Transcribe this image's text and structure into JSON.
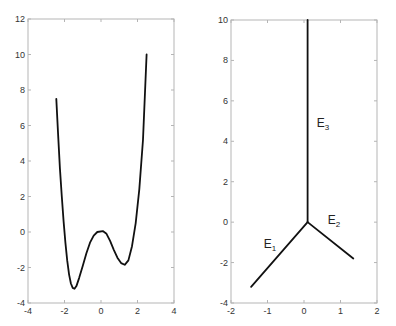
{
  "chart_data": [
    {
      "type": "line",
      "title": "",
      "xlabel": "",
      "ylabel": "",
      "xlim": [
        -4,
        4
      ],
      "ylim": [
        -4,
        12
      ],
      "xticks": [
        -4,
        -2,
        0,
        2,
        4
      ],
      "yticks": [
        -4,
        -2,
        0,
        2,
        4,
        6,
        8,
        10,
        12
      ],
      "grid": false,
      "legend": null,
      "frame_px": {
        "left": 28,
        "right": 174,
        "top": 19,
        "bottom": 303
      },
      "series": [
        {
          "name": "curve",
          "color": "#111111",
          "x": [
            -2.45,
            -2.35,
            -2.25,
            -2.15,
            -2.05,
            -1.95,
            -1.85,
            -1.75,
            -1.65,
            -1.55,
            -1.45,
            -1.35,
            -1.2,
            -1.0,
            -0.8,
            -0.6,
            -0.4,
            -0.2,
            0.1,
            0.3,
            0.5,
            0.7,
            0.9,
            1.1,
            1.3,
            1.5,
            1.7,
            1.9,
            2.1,
            2.3,
            2.5
          ],
          "y": [
            7.5,
            5.5,
            3.6,
            2.0,
            0.6,
            -0.6,
            -1.6,
            -2.4,
            -2.9,
            -3.15,
            -3.2,
            -3.05,
            -2.6,
            -1.9,
            -1.2,
            -0.6,
            -0.2,
            0.0,
            0.05,
            -0.1,
            -0.5,
            -1.0,
            -1.45,
            -1.75,
            -1.85,
            -1.6,
            -0.8,
            0.5,
            2.4,
            5.2,
            10.0
          ]
        }
      ]
    },
    {
      "type": "line",
      "title": "",
      "xlabel": "",
      "ylabel": "",
      "xlim": [
        -2,
        2
      ],
      "ylim": [
        -4,
        10
      ],
      "xticks": [
        -2,
        -1,
        0,
        1,
        2
      ],
      "yticks": [
        -4,
        -2,
        0,
        2,
        4,
        6,
        8,
        10
      ],
      "grid": false,
      "legend": null,
      "frame_px": {
        "left": 231,
        "right": 377,
        "top": 20,
        "bottom": 303
      },
      "series": [
        {
          "name": "E1",
          "color": "#111111",
          "x": [
            0.1,
            -1.45
          ],
          "y": [
            0.0,
            -3.2
          ]
        },
        {
          "name": "E2",
          "color": "#111111",
          "x": [
            0.1,
            1.35
          ],
          "y": [
            0.0,
            -1.8
          ]
        },
        {
          "name": "E3",
          "color": "#111111",
          "x": [
            0.1,
            0.1
          ],
          "y": [
            0.0,
            10.0
          ]
        }
      ],
      "annotations": [
        {
          "text": "E",
          "sub": "1",
          "x": -1.1,
          "y": -1.3
        },
        {
          "text": "E",
          "sub": "2",
          "x": 0.65,
          "y": -0.1
        },
        {
          "text": "E",
          "sub": "3",
          "x": 0.35,
          "y": 4.7
        }
      ]
    }
  ]
}
